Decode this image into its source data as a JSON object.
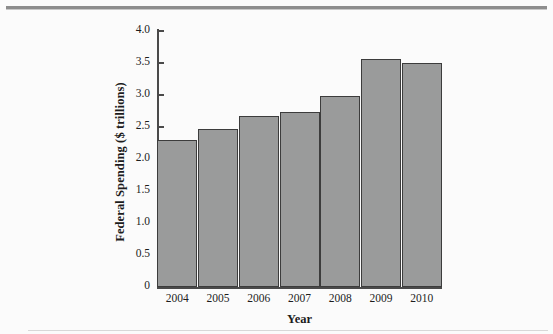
{
  "chart_data": {
    "type": "bar",
    "title": "",
    "categories": [
      "2004",
      "2005",
      "2006",
      "2007",
      "2008",
      "2009",
      "2010"
    ],
    "values": [
      2.3,
      2.47,
      2.67,
      2.73,
      2.99,
      3.56,
      3.5
    ],
    "xlabel": "Year",
    "ylabel": "Federal Spending ($ trillions)",
    "ylim": [
      0,
      4.0
    ],
    "ytick_labels": [
      "0",
      "0.5",
      "1.0",
      "1.5",
      "2.0",
      "2.5",
      "3.0",
      "3.5",
      "4.0"
    ],
    "ytick_values": [
      0,
      0.5,
      1.0,
      1.5,
      2.0,
      2.5,
      3.0,
      3.5,
      4.0
    ],
    "grid": false,
    "legend": false,
    "bar_color": "#9a9b9b",
    "bar_edge_color": "#3c3c3c",
    "axis_color": "#4a4a4a",
    "background_color": "#fbfbfb"
  }
}
